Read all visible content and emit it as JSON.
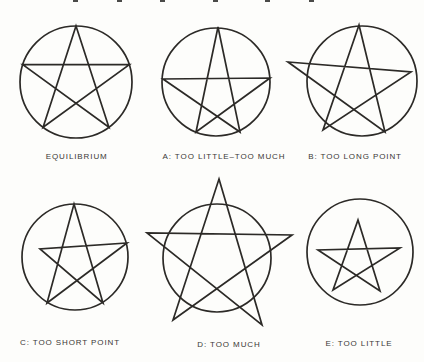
{
  "figure": {
    "background": "#fdfdfb",
    "stroke_color": "#2c2a27",
    "label_color": "#3b3836",
    "cropped_caption": {
      "fragments_x": [
        73,
        117,
        160,
        213,
        265,
        309
      ]
    },
    "diagrams": [
      {
        "id": "equilibrium",
        "label": "EQUILIBRIUM",
        "label_cx": 76.7,
        "label_y": 151.5,
        "circle": {
          "cx": 76,
          "cy": 82,
          "r": 56
        },
        "star_points": [
          [
            76,
            26
          ],
          [
            108.9,
            127.3
          ],
          [
            22.8,
            64.7
          ],
          [
            129.3,
            64.7
          ],
          [
            43.1,
            127.3
          ]
        ]
      },
      {
        "id": "a-too-little-too-much",
        "label": "A: TOO LITTLE–TOO MUCH",
        "label_cx": 224,
        "label_y": 151.5,
        "circle": {
          "cx": 216,
          "cy": 82,
          "r": 54
        },
        "star_points": [
          [
            218,
            27
          ],
          [
            240,
            132
          ],
          [
            163,
            79
          ],
          [
            270,
            78
          ],
          [
            196,
            132
          ]
        ]
      },
      {
        "id": "b-too-long-point",
        "label": "B: TOO LONG POINT",
        "label_cx": 355,
        "label_y": 151.5,
        "circle": {
          "cx": 362,
          "cy": 81,
          "r": 55
        },
        "star_points": [
          [
            359,
            25
          ],
          [
            385,
            132
          ],
          [
            288,
            62
          ],
          [
            411,
            72
          ],
          [
            323,
            130
          ]
        ]
      },
      {
        "id": "c-too-short-point",
        "label": "C: TOO SHORT POINT",
        "label_cx": 70,
        "label_y": 337.5,
        "circle": {
          "cx": 75,
          "cy": 257,
          "r": 53
        },
        "star_points": [
          [
            74,
            204
          ],
          [
            103,
            303
          ],
          [
            40,
            249
          ],
          [
            127,
            243
          ],
          [
            47,
            303
          ]
        ]
      },
      {
        "id": "d-too-much",
        "label": "D: TOO MUCH",
        "label_cx": 229,
        "label_y": 340,
        "circle": {
          "cx": 217,
          "cy": 258,
          "r": 54
        },
        "star_points": [
          [
            219,
            179
          ],
          [
            262,
            325
          ],
          [
            147,
            233
          ],
          [
            292,
            235
          ],
          [
            173,
            320
          ]
        ]
      },
      {
        "id": "e-too-little",
        "label": "E: TOO LITTLE",
        "label_cx": 359,
        "label_y": 338.5,
        "circle": {
          "cx": 360,
          "cy": 252,
          "r": 53
        },
        "star_points": [
          [
            358,
            220
          ],
          [
            380,
            291
          ],
          [
            318,
            250
          ],
          [
            400,
            248
          ],
          [
            333,
            290
          ]
        ]
      }
    ]
  }
}
